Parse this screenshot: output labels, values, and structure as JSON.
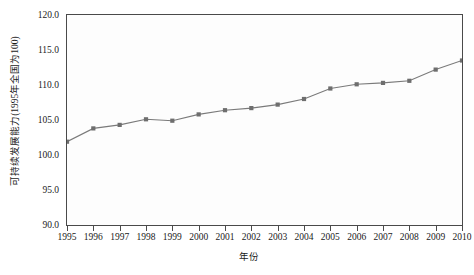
{
  "chart_data": {
    "type": "line",
    "title": "",
    "xlabel": "年份",
    "ylabel": "可持续发展能力(1995年全国为100)",
    "categories": [
      "1995",
      "1996",
      "1997",
      "1998",
      "1999",
      "2000",
      "2001",
      "2002",
      "2003",
      "2004",
      "2005",
      "2006",
      "2007",
      "2008",
      "2009",
      "2010"
    ],
    "x": [
      1995,
      1996,
      1997,
      1998,
      1999,
      2000,
      2001,
      2002,
      2003,
      2004,
      2005,
      2006,
      2007,
      2008,
      2009,
      2010
    ],
    "values": [
      101.9,
      103.8,
      104.3,
      105.1,
      104.9,
      105.8,
      106.4,
      106.7,
      107.2,
      108.0,
      109.5,
      110.1,
      110.3,
      110.6,
      112.2,
      113.5
    ],
    "series": [
      {
        "name": "可持续发展能力",
        "values": [
          101.9,
          103.8,
          104.3,
          105.1,
          104.9,
          105.8,
          106.4,
          106.7,
          107.2,
          108.0,
          109.5,
          110.1,
          110.3,
          110.6,
          112.2,
          113.5
        ]
      }
    ],
    "ylim": [
      90.0,
      120.0
    ],
    "yticks": [
      "90.0",
      "95.0",
      "100.0",
      "105.0",
      "110.0",
      "115.0",
      "120.0"
    ],
    "ytick_values": [
      90.0,
      95.0,
      100.0,
      105.0,
      110.0,
      115.0,
      120.0
    ],
    "xlim": [
      1995,
      2010
    ],
    "grid": false,
    "legend": "none",
    "line_color": "#7a7a7a",
    "marker_color": "#6e6e6e",
    "marker_shape": "square",
    "frame_color": "#4a4a4a",
    "background_color": "#fdfdfd"
  }
}
